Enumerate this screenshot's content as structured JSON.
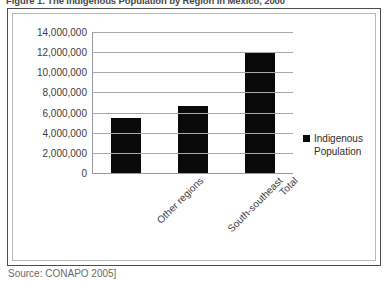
{
  "figure": {
    "caption": "Figure 1. The Indigenous Population by Region in Mexico, 2000",
    "source": "Source: CONAPO 2005]"
  },
  "legend": {
    "entries": [
      {
        "label_line1": "Indigenous",
        "label_line2": "Population",
        "color": "#0a0a0a"
      }
    ]
  },
  "chart_data": {
    "type": "bar",
    "title": "Figure 1. The Indigenous Population by Region in Mexico, 2000",
    "categories": [
      "Other regions",
      "South-southeast",
      "Total"
    ],
    "series": [
      {
        "name": "Indigenous Population",
        "color": "#0a0a0a",
        "values": [
          5500000,
          6650000,
          12000000
        ]
      }
    ],
    "values": [
      5500000,
      6650000,
      12000000
    ],
    "xlabel": "",
    "ylabel": "",
    "ylim": [
      0,
      14000000
    ],
    "ytick_step": 2000000,
    "yticks": [
      14000000,
      12000000,
      10000000,
      8000000,
      6000000,
      4000000,
      2000000,
      0
    ],
    "ytick_labels": [
      "14,000,000",
      "12,000,000",
      "10,000,000",
      "8,000,000",
      "6,000,000",
      "4,000,000",
      "2,000,000",
      "0"
    ],
    "grid": true,
    "grid_axis": "y",
    "legend_position": "right",
    "bar_color": "#0a0a0a",
    "plot_background": "#ffffff"
  }
}
